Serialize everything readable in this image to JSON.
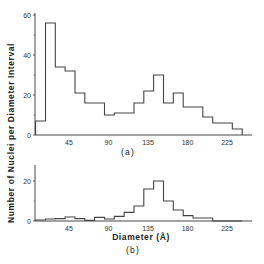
{
  "figure": {
    "ylabel": "Number of Nuclei per Diameter Interval",
    "xlabel": "Diameter  (Å)",
    "panel_a_label": "(a)",
    "panel_b_label": "(b)"
  },
  "colors": {
    "line": "#444444",
    "axis": "#333333",
    "background": "#ffffff"
  },
  "chart_data": [
    {
      "type": "bar",
      "subtype": "histogram-step",
      "panel": "(a)",
      "title": "",
      "xlabel": "",
      "ylabel": "Number of Nuclei per Diameter Interval",
      "xticks": [
        45,
        90,
        135,
        180,
        225
      ],
      "yticks": [
        0,
        20,
        40,
        60
      ],
      "ylim": [
        0,
        60
      ],
      "xlim": [
        0,
        255
      ],
      "bin_width": 11.2,
      "bin_start": 7,
      "categories": [
        12.6,
        23.8,
        35.0,
        46.2,
        57.4,
        68.6,
        79.8,
        91.0,
        102.2,
        113.4,
        124.6,
        135.8,
        147.0,
        158.2,
        169.4,
        180.6,
        191.8,
        203.0,
        214.2,
        225.4,
        236.6
      ],
      "values": [
        7,
        56,
        34,
        32,
        21,
        16,
        16,
        10,
        11,
        11,
        16,
        22,
        30,
        16,
        21,
        14,
        14,
        9,
        6,
        6,
        3
      ],
      "grid": false
    },
    {
      "type": "bar",
      "subtype": "histogram-step",
      "panel": "(b)",
      "title": "",
      "xlabel": "Diameter (Å)",
      "ylabel": "Number of Nuclei per Diameter Interval",
      "xticks": [
        45,
        90,
        135,
        180,
        225
      ],
      "yticks": [
        0,
        20
      ],
      "ylim": [
        0,
        30
      ],
      "xlim": [
        0,
        255
      ],
      "bin_width": 11.2,
      "bin_start": 7,
      "categories": [
        12.6,
        23.8,
        35.0,
        46.2,
        57.4,
        68.6,
        79.8,
        91.0,
        102.2,
        113.4,
        124.6,
        135.8,
        147.0,
        158.2,
        169.4,
        180.6,
        191.8,
        203.0,
        214.2,
        225.4,
        236.6
      ],
      "values": [
        0.5,
        1,
        1.2,
        2,
        1.2,
        0.3,
        1.8,
        1,
        2.3,
        4.3,
        7.5,
        16,
        20,
        10,
        5.5,
        2.7,
        1.5,
        1.5,
        0,
        0,
        0
      ],
      "grid": false
    }
  ]
}
